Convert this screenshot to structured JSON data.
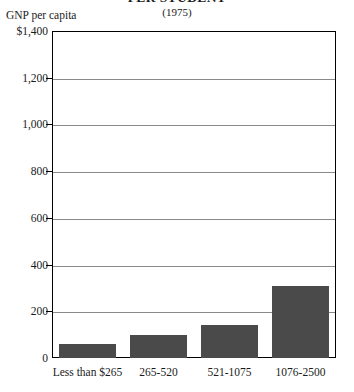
{
  "chart_data": {
    "type": "bar",
    "title": "PER STUDENT",
    "subtitle": "(1975)",
    "ylabel": "GNP per capita",
    "xlabel": "",
    "categories": [
      "Less than $265",
      "265-520",
      "521-1075",
      "1076-2500"
    ],
    "values": [
      60,
      100,
      140,
      310
    ],
    "ylim": [
      0,
      1400
    ],
    "yticks": [
      0,
      200,
      400,
      600,
      800,
      1000,
      1200,
      1400
    ],
    "ytick_labels": [
      "0",
      "200",
      "400",
      "600",
      "800",
      "1,000",
      "1,200",
      "$1,400"
    ],
    "grid": true,
    "legend": null,
    "bar_color": "#4a4a4a",
    "frame_color": "#000000",
    "gridline_color": "#8a8a8a",
    "background": "#ffffff"
  }
}
